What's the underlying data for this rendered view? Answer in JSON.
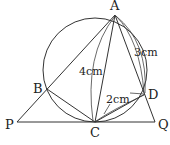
{
  "diagram": {
    "type": "geometry",
    "points": {
      "A": {
        "label": "A",
        "x": 115,
        "y": 15
      },
      "B": {
        "label": "B",
        "x": 47,
        "y": 89
      },
      "C": {
        "label": "C",
        "x": 95,
        "y": 122
      },
      "D": {
        "label": "D",
        "x": 145,
        "y": 94
      },
      "P": {
        "label": "P",
        "x": 17,
        "y": 122
      },
      "Q": {
        "label": "Q",
        "x": 155,
        "y": 122
      }
    },
    "circle": {
      "cx": 95,
      "cy": 70,
      "r": 52
    },
    "measurements": {
      "AC": "4cm",
      "AD": "3cm",
      "CD": "2cm"
    },
    "labels": {
      "A": "A",
      "B": "B",
      "C": "C",
      "D": "D",
      "P": "P",
      "Q": "Q"
    }
  }
}
